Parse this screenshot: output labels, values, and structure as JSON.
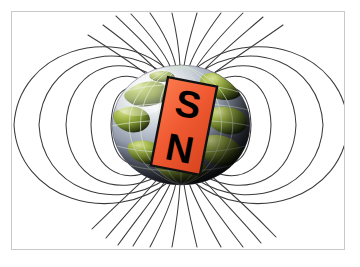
{
  "figure": {
    "title": "Earth's magnetic field represented as a tilted bar magnet",
    "canvas": {
      "width": 360,
      "height": 267,
      "background_color": "#ffffff",
      "frame_color": "#c9c9c9",
      "frame_rect": [
        11,
        11,
        334,
        239
      ]
    },
    "globe": {
      "name": "earth-globe",
      "center": [
        181,
        125
      ],
      "radius_x": 69,
      "radius_y": 60,
      "ocean_color": "#8e96ab",
      "ocean_highlight_color": "#f2f4f6",
      "land_color": "#8fa43a",
      "land_dark_color": "#3d4a1c",
      "shadow_color": "#13160c",
      "graticule_color": "#cfe0c8",
      "graticule_count_meridians": 7,
      "graticule_count_parallels": 5
    },
    "magnet": {
      "name": "bar-magnet",
      "body_color": "#f05a32",
      "outline_color": "#111111",
      "label_color": "#000000",
      "tilt_degrees": 11,
      "south_pole_label": "S",
      "north_pole_label": "N",
      "rect": [
        159,
        81,
        50,
        90
      ]
    },
    "field_lines": {
      "name": "magnetic-field-lines",
      "color": "#3b3b3b",
      "stroke_width": 1.05,
      "loop_count_per_side": 5,
      "radial_count": 18,
      "description": "Dipole field lines looping from the south pole at top to the north pole at bottom"
    }
  }
}
